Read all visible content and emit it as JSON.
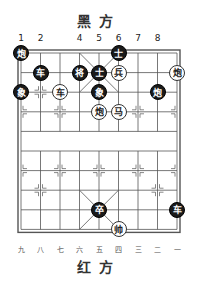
{
  "header": {
    "top_side": "黑方",
    "bottom_side": "红方"
  },
  "top_numbers": [
    {
      "label": "1",
      "col": 0
    },
    {
      "label": "2",
      "col": 1
    },
    {
      "label": "4",
      "col": 3
    },
    {
      "label": "5",
      "col": 4
    },
    {
      "label": "6",
      "col": 5
    },
    {
      "label": "7",
      "col": 6
    },
    {
      "label": "8",
      "col": 7
    }
  ],
  "bottom_numbers": [
    "九",
    "八",
    "七",
    "六",
    "五",
    "四",
    "三",
    "二",
    "一"
  ],
  "board": {
    "cols": 9,
    "rows": 10,
    "x0": 21,
    "y0": 53,
    "dx": 19.5,
    "dy": 19.6,
    "line_color": "#555555"
  },
  "pieces": [
    {
      "side": "black",
      "char": "炮",
      "col": 0,
      "row": 0
    },
    {
      "side": "black",
      "char": "士",
      "col": 5,
      "row": 0
    },
    {
      "side": "black",
      "char": "车",
      "col": 1,
      "row": 1
    },
    {
      "side": "black",
      "char": "将",
      "col": 3,
      "row": 1
    },
    {
      "side": "black",
      "char": "士",
      "col": 4,
      "row": 1
    },
    {
      "side": "red",
      "char": "兵",
      "col": 5,
      "row": 1
    },
    {
      "side": "red",
      "char": "炮",
      "col": 8,
      "row": 1
    },
    {
      "side": "black",
      "char": "象",
      "col": 0,
      "row": 2
    },
    {
      "side": "red",
      "char": "车",
      "col": 2,
      "row": 2
    },
    {
      "side": "black",
      "char": "象",
      "col": 4,
      "row": 2
    },
    {
      "side": "black",
      "char": "炮",
      "col": 7,
      "row": 2
    },
    {
      "side": "red",
      "char": "炮",
      "col": 4,
      "row": 3
    },
    {
      "side": "red",
      "char": "马",
      "col": 5,
      "row": 3
    },
    {
      "side": "black",
      "char": "卒",
      "col": 4,
      "row": 8
    },
    {
      "side": "black",
      "char": "车",
      "col": 8,
      "row": 8
    },
    {
      "side": "red",
      "char": "帅",
      "col": 5,
      "row": 9
    }
  ]
}
